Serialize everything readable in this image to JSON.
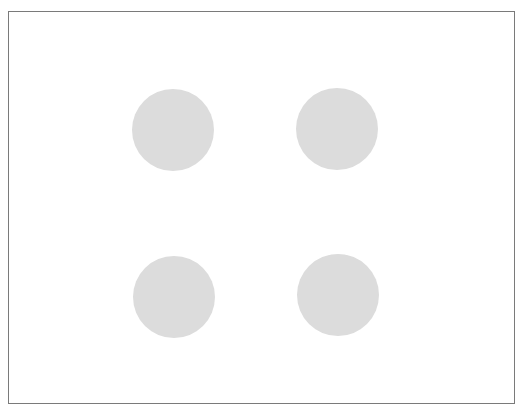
{
  "figure": {
    "frame": {
      "left": 8,
      "top": 11,
      "width": 505,
      "height": 391,
      "border_color": "#7a7a7a",
      "background": "#ffffff"
    },
    "dot_color": "#dcdcdc",
    "dots": [
      {
        "name": "top-left",
        "cx": 173,
        "cy": 130,
        "r": 41
      },
      {
        "name": "top-right",
        "cx": 337,
        "cy": 129,
        "r": 41
      },
      {
        "name": "bottom-left",
        "cx": 174,
        "cy": 297,
        "r": 41
      },
      {
        "name": "bottom-right",
        "cx": 338,
        "cy": 295,
        "r": 41
      }
    ]
  }
}
